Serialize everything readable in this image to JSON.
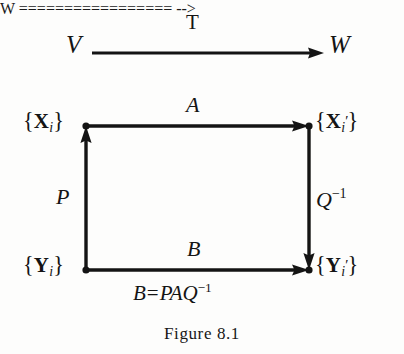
{
  "figure": {
    "caption": "Figure 8.1",
    "background_color": "#fdfdfc",
    "ink_color": "#141414"
  },
  "top_row": {
    "source": "V",
    "target": "W",
    "map_label": "T",
    "arrow_direction": "right"
  },
  "square": {
    "top_left": {
      "brace_open": "{",
      "symbol": "X",
      "subscript": "i",
      "prime": "",
      "brace_close": "}"
    },
    "top_right": {
      "brace_open": "{",
      "symbol": "X",
      "subscript": "i",
      "prime": "′",
      "brace_close": "}"
    },
    "bottom_left": {
      "brace_open": "{",
      "symbol": "Y",
      "subscript": "i",
      "prime": "",
      "brace_close": "}"
    },
    "bottom_right": {
      "brace_open": "{",
      "symbol": "Y",
      "subscript": "i",
      "prime": "′",
      "brace_close": "}"
    },
    "edges": {
      "top": {
        "label": "A",
        "direction": "right"
      },
      "bottom": {
        "label": "B",
        "direction": "right"
      },
      "left": {
        "label": "P",
        "direction": "up"
      },
      "right": {
        "label_base": "Q",
        "label_exponent": "−1",
        "direction": "down"
      }
    },
    "relation": {
      "lhs": "B",
      "equals": "=",
      "rhs_base": "PAQ",
      "rhs_exponent": "−1"
    }
  }
}
